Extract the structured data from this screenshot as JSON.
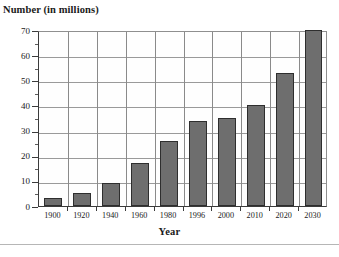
{
  "chart_data": {
    "type": "bar",
    "title": "",
    "ylabel": "Number (in millions)",
    "xlabel": "Year",
    "categories": [
      "1900",
      "1920",
      "1940",
      "1960",
      "1980",
      "1996",
      "2000",
      "2010",
      "2020",
      "2030"
    ],
    "values": [
      3,
      5,
      9,
      17,
      26,
      34,
      35,
      40,
      53,
      70
    ],
    "series": [
      {
        "name": "Number (in millions)",
        "values": [
          3,
          5,
          9,
          17,
          26,
          34,
          35,
          40,
          53,
          70
        ]
      }
    ],
    "ylim": [
      0,
      70
    ],
    "ytick_labels": [
      "0",
      "10",
      "20",
      "30",
      "40",
      "50",
      "60",
      "70"
    ],
    "ytick_values": [
      0,
      10,
      20,
      30,
      40,
      50,
      60,
      70
    ],
    "ytick_step": 10,
    "grid": "both",
    "legend": "none",
    "bar_color": "#6e6e6e",
    "bar_edge_color": "#2e2e2e",
    "grid_color": "#9a9a9a",
    "axis_color": "#3b3b3b",
    "background_color": "#ffffff"
  },
  "footer": {
    "caption": ""
  }
}
